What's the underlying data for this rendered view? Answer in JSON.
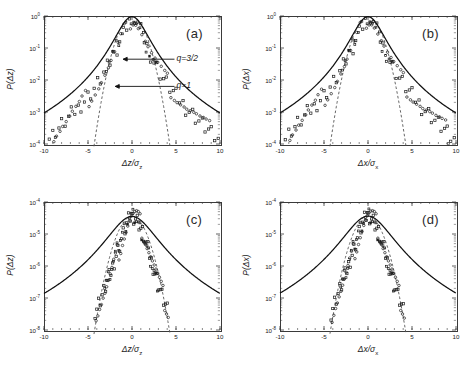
{
  "figure": {
    "background": "#ffffff",
    "panel_count": 4,
    "marker_color": "#1a1a1a",
    "fit_color": "#111111",
    "gaussian_color": "#555555"
  },
  "chart_data": [
    {
      "id": "a",
      "type": "scatter",
      "panel_label": "(a)",
      "title": "",
      "xlabel": "Δz/σ",
      "xlabel_sub": "z",
      "ylabel": "P(Δz)",
      "xlim": [
        -10,
        10
      ],
      "ylim_log10": [
        -4,
        0
      ],
      "xticks": [
        -10,
        -5,
        0,
        5,
        10
      ],
      "xticklabels": [
        "-10",
        "-5",
        "0",
        "5",
        "10"
      ],
      "yticks_log10": [
        0,
        -1,
        -2,
        -3,
        -4
      ],
      "yticklabels": [
        "10",
        "10",
        "10",
        "10",
        "10"
      ],
      "yticklabel_exponents": [
        "0",
        "-1",
        "-2",
        "-3",
        "-4"
      ],
      "grid": false,
      "legend": "none",
      "annotations": [
        {
          "text": "q=3/2",
          "x": 4.6,
          "y_log10": -1.35
        },
        {
          "text": "q=1",
          "x": 4.6,
          "y_log10": -2.2
        }
      ],
      "series": [
        {
          "name": "q-exponential fit (q=3/2)",
          "style": "solid-curve",
          "q": 1.5,
          "beta": 0.62
        },
        {
          "name": "Gaussian reference (q=1)",
          "style": "dashed-curve",
          "q": 1.0,
          "sigma": 1.0
        },
        {
          "name": "experimental PDF",
          "style": "open-markers",
          "x": [
            -9.8,
            -9.4,
            -9.0,
            -8.7,
            -8.3,
            -8.0,
            -7.6,
            -7.2,
            -6.9,
            -6.5,
            -6.1,
            -5.8,
            -5.4,
            -5.0,
            -4.7,
            -4.3,
            -3.9,
            -3.6,
            -3.2,
            -2.8,
            -2.5,
            -2.1,
            -1.7,
            -1.4,
            -1.0,
            -0.6,
            -0.3,
            0.0,
            0.3,
            0.6,
            1.0,
            1.4,
            1.7,
            2.1,
            2.5,
            2.8,
            3.2,
            3.6,
            3.9,
            4.3,
            4.7,
            5.0,
            5.4,
            5.8,
            6.1,
            6.5,
            6.9,
            7.2,
            7.6,
            8.0,
            8.3,
            8.7,
            9.0,
            9.4,
            9.8
          ],
          "y_log10": [
            -3.95,
            -3.8,
            -3.72,
            -3.6,
            -3.5,
            -3.4,
            -3.3,
            -3.18,
            -3.08,
            -2.98,
            -2.88,
            -2.76,
            -2.64,
            -2.52,
            -2.4,
            -2.26,
            -2.12,
            -1.98,
            -1.8,
            -1.62,
            -1.44,
            -1.22,
            -0.98,
            -0.76,
            -0.5,
            -0.25,
            -0.09,
            -0.02,
            -0.08,
            -0.24,
            -0.48,
            -0.74,
            -0.96,
            -1.2,
            -1.42,
            -1.6,
            -1.78,
            -1.96,
            -2.1,
            -2.24,
            -2.38,
            -2.5,
            -2.62,
            -2.74,
            -2.86,
            -2.96,
            -3.06,
            -3.16,
            -3.28,
            -3.38,
            -3.48,
            -3.58,
            -3.7,
            -3.8,
            -3.92
          ]
        }
      ]
    },
    {
      "id": "b",
      "type": "scatter",
      "panel_label": "(b)",
      "title": "",
      "xlabel": "Δx/σ",
      "xlabel_sub": "x",
      "ylabel": "P(Δx)",
      "xlim": [
        -10,
        10
      ],
      "ylim_log10": [
        -4,
        0
      ],
      "xticks": [
        -10,
        -5,
        0,
        5,
        10
      ],
      "xticklabels": [
        "-10",
        "-5",
        "0",
        "5",
        "10"
      ],
      "yticks_log10": [
        0,
        -1,
        -2,
        -3,
        -4
      ],
      "yticklabels": [
        "10",
        "10",
        "10",
        "10",
        "10"
      ],
      "yticklabel_exponents": [
        "0",
        "-1",
        "-2",
        "-3",
        "-4"
      ],
      "grid": false,
      "legend": "none",
      "annotations": [],
      "series": [
        {
          "name": "q-exponential fit (q=3/2)",
          "style": "solid-curve",
          "q": 1.5,
          "beta": 0.62
        },
        {
          "name": "Gaussian reference (q=1)",
          "style": "dashed-curve",
          "q": 1.0,
          "sigma": 1.0
        },
        {
          "name": "experimental PDF",
          "style": "open-markers",
          "x": [
            -9.8,
            -9.4,
            -9.0,
            -8.7,
            -8.3,
            -8.0,
            -7.6,
            -7.2,
            -6.9,
            -6.5,
            -6.1,
            -5.8,
            -5.4,
            -5.0,
            -4.7,
            -4.3,
            -3.9,
            -3.6,
            -3.2,
            -2.8,
            -2.5,
            -2.1,
            -1.7,
            -1.4,
            -1.0,
            -0.6,
            -0.3,
            0.0,
            0.3,
            0.6,
            1.0,
            1.4,
            1.7,
            2.1,
            2.5,
            2.8,
            3.2,
            3.6,
            3.9,
            4.3,
            4.7,
            5.0,
            5.4,
            5.8,
            6.1,
            6.5,
            6.9,
            7.2,
            7.6,
            8.0,
            8.3,
            8.7,
            9.0,
            9.4,
            9.8
          ],
          "y_log10": [
            -3.9,
            -3.82,
            -3.68,
            -3.56,
            -3.46,
            -3.36,
            -3.26,
            -3.14,
            -3.04,
            -2.94,
            -2.84,
            -2.72,
            -2.6,
            -2.48,
            -2.36,
            -2.22,
            -2.08,
            -1.94,
            -1.76,
            -1.58,
            -1.4,
            -1.18,
            -0.94,
            -0.72,
            -0.46,
            -0.22,
            -0.07,
            -0.02,
            -0.07,
            -0.22,
            -0.46,
            -0.72,
            -0.94,
            -1.18,
            -1.4,
            -1.58,
            -1.76,
            -1.94,
            -2.08,
            -2.22,
            -2.36,
            -2.48,
            -2.6,
            -2.72,
            -2.84,
            -2.94,
            -3.04,
            -3.14,
            -3.26,
            -3.36,
            -3.46,
            -3.56,
            -3.68,
            -3.82,
            -3.9
          ]
        }
      ]
    },
    {
      "id": "c",
      "type": "scatter",
      "panel_label": "(c)",
      "title": "",
      "xlabel": "Δz/σ",
      "xlabel_sub": "z",
      "ylabel": "P(Δz)",
      "xlim": [
        -10,
        10
      ],
      "ylim_log10": [
        -8,
        -4
      ],
      "xticks": [
        -10,
        -5,
        0,
        5,
        10
      ],
      "xticklabels": [
        "-10",
        "-5",
        "0",
        "5",
        "10"
      ],
      "yticks_log10": [
        -4,
        -5,
        -6,
        -7,
        -8
      ],
      "yticklabels": [
        "10",
        "10",
        "10",
        "10",
        "10"
      ],
      "yticklabel_exponents": [
        "-4",
        "-5",
        "-6",
        "-7",
        "-8"
      ],
      "grid": false,
      "legend": "none",
      "annotations": [],
      "series": [
        {
          "name": "q-exponential fit",
          "style": "solid-curve",
          "q": 1.5,
          "beta": 0.3
        },
        {
          "name": "Gaussian reference",
          "style": "dashed-curve",
          "q": 1.0,
          "sigma": 1.05
        },
        {
          "name": "experimental PDF",
          "style": "open-markers",
          "x": [
            -4.2,
            -4.0,
            -3.8,
            -3.6,
            -3.4,
            -3.2,
            -3.0,
            -2.8,
            -2.6,
            -2.4,
            -2.2,
            -2.0,
            -1.8,
            -1.6,
            -1.4,
            -1.2,
            -1.0,
            -0.8,
            -0.6,
            -0.4,
            -0.2,
            0.0,
            0.2,
            0.4,
            0.6,
            0.8,
            1.0,
            1.2,
            1.4,
            1.6,
            1.8,
            2.0,
            2.2,
            2.4,
            2.6,
            2.8,
            3.0,
            3.2,
            3.4,
            3.6,
            3.8,
            4.0
          ],
          "y_log10": [
            -7.4,
            -7.3,
            -7.15,
            -7.05,
            -6.9,
            -6.8,
            -6.65,
            -6.5,
            -6.35,
            -6.2,
            -6.0,
            -5.85,
            -5.65,
            -5.5,
            -5.35,
            -5.15,
            -5.0,
            -4.85,
            -4.7,
            -4.58,
            -4.5,
            -4.46,
            -4.45,
            -4.48,
            -4.56,
            -4.68,
            -4.82,
            -4.96,
            -5.12,
            -5.3,
            -5.48,
            -5.66,
            -5.84,
            -6.02,
            -6.2,
            -6.38,
            -6.56,
            -6.74,
            -6.92,
            -7.08,
            -7.24,
            -7.4
          ]
        }
      ]
    },
    {
      "id": "d",
      "type": "scatter",
      "panel_label": "(d)",
      "title": "",
      "xlabel": "Δx/σ",
      "xlabel_sub": "x",
      "ylabel": "P(Δx)",
      "xlim": [
        -10,
        10
      ],
      "ylim_log10": [
        -8,
        -4
      ],
      "xticks": [
        -10,
        -5,
        0,
        5,
        10
      ],
      "xticklabels": [
        "-10",
        "-5",
        "0",
        "5",
        "10"
      ],
      "yticks_log10": [
        -4,
        -5,
        -6,
        -7,
        -8
      ],
      "yticklabels": [
        "10",
        "10",
        "10",
        "10",
        "10"
      ],
      "yticklabel_exponents": [
        "-4",
        "-5",
        "-6",
        "-7",
        "-8"
      ],
      "grid": false,
      "legend": "none",
      "annotations": [],
      "series": [
        {
          "name": "q-exponential fit",
          "style": "solid-curve",
          "q": 1.5,
          "beta": 0.3
        },
        {
          "name": "Gaussian reference",
          "style": "dashed-curve",
          "q": 1.0,
          "sigma": 1.05
        },
        {
          "name": "experimental PDF",
          "style": "open-markers",
          "x": [
            -4.2,
            -4.0,
            -3.8,
            -3.6,
            -3.4,
            -3.2,
            -3.0,
            -2.8,
            -2.6,
            -2.4,
            -2.2,
            -2.0,
            -1.8,
            -1.6,
            -1.4,
            -1.2,
            -1.0,
            -0.8,
            -0.6,
            -0.4,
            -0.2,
            0.0,
            0.2,
            0.4,
            0.6,
            0.8,
            1.0,
            1.2,
            1.4,
            1.6,
            1.8,
            2.0,
            2.2,
            2.4,
            2.6,
            2.8,
            3.0,
            3.2,
            3.4,
            3.6,
            3.8,
            4.0
          ],
          "y_log10": [
            -7.45,
            -7.28,
            -7.12,
            -7.0,
            -6.86,
            -6.74,
            -6.6,
            -6.46,
            -6.3,
            -6.14,
            -5.96,
            -5.8,
            -5.62,
            -5.46,
            -5.3,
            -5.12,
            -4.96,
            -4.82,
            -4.68,
            -4.56,
            -4.48,
            -4.44,
            -4.44,
            -4.48,
            -4.56,
            -4.68,
            -4.82,
            -4.96,
            -5.12,
            -5.3,
            -5.48,
            -5.66,
            -5.84,
            -6.02,
            -6.2,
            -6.38,
            -6.56,
            -6.74,
            -6.92,
            -7.08,
            -7.24,
            -7.42
          ]
        }
      ]
    }
  ]
}
